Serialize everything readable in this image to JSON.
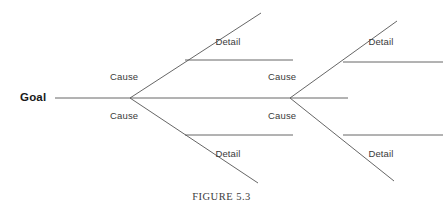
{
  "figure": {
    "caption": "FIGURE 5.3",
    "type": "fishbone-diagram",
    "line_color": "#555555",
    "label_color": "#3a3a3a",
    "goal_color": "#1a1a1a",
    "background": "#ffffff"
  },
  "diagram": {
    "goal_label": "Goal",
    "spine": {
      "x1": 55,
      "y1": 98,
      "x2": 348,
      "y2": 98
    },
    "branch_groups": [
      {
        "vertex": {
          "x": 130,
          "y": 98
        },
        "bones": [
          {
            "cause_label": "Cause",
            "cause_pos": {
              "x": 110,
              "y": 71
            },
            "bone": {
              "x1": 130,
              "y1": 98,
              "x2": 261,
              "y2": 13
            },
            "detail_label": "Detail",
            "detail_pos": {
              "x": 228,
              "y": 36
            },
            "detail_line": {
              "x1": 185,
              "y1": 60,
              "x2": 293,
              "y2": 60
            }
          },
          {
            "cause_label": "Cause",
            "cause_pos": {
              "x": 110,
              "y": 110
            },
            "bone": {
              "x1": 130,
              "y1": 98,
              "x2": 258,
              "y2": 183
            },
            "detail_label": "Detail",
            "detail_pos": {
              "x": 228,
              "y": 148
            },
            "detail_line": {
              "x1": 185,
              "y1": 135,
              "x2": 293,
              "y2": 135
            }
          }
        ]
      },
      {
        "vertex": {
          "x": 290,
          "y": 98
        },
        "bones": [
          {
            "cause_label": "Cause",
            "cause_pos": {
              "x": 268,
              "y": 71
            },
            "bone": {
              "x1": 290,
              "y1": 98,
              "x2": 397,
              "y2": 21
            },
            "detail_label": "Detail",
            "detail_pos": {
              "x": 381,
              "y": 36
            },
            "detail_line": {
              "x1": 343,
              "y1": 62,
              "x2": 443,
              "y2": 62
            }
          },
          {
            "cause_label": "Cause",
            "cause_pos": {
              "x": 268,
              "y": 110
            },
            "bone": {
              "x1": 290,
              "y1": 98,
              "x2": 394,
              "y2": 181
            },
            "detail_label": "Detail",
            "detail_pos": {
              "x": 381,
              "y": 148
            },
            "detail_line": {
              "x1": 343,
              "y1": 135,
              "x2": 443,
              "y2": 135
            }
          }
        ]
      }
    ]
  }
}
